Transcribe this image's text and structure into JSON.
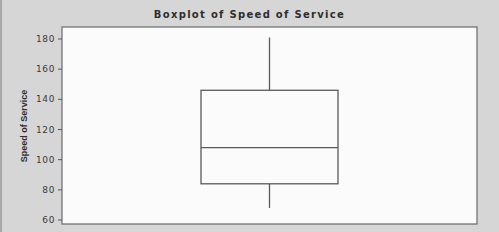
{
  "chart_data": {
    "type": "boxplot",
    "title": "Boxplot of Speed of Service",
    "xlabel": "",
    "ylabel": "Speed of Service",
    "ylim": [
      58,
      183
    ],
    "yticks": [
      60,
      80,
      100,
      120,
      140,
      160,
      180
    ],
    "grid": false,
    "legend": null,
    "series": [
      {
        "name": "Speed of Service",
        "whisker_low": 68,
        "q1": 84,
        "median": 108,
        "q3": 146,
        "whisker_high": 181
      }
    ]
  },
  "colors": {
    "background": "#d6d6d6",
    "plot_area": "#fbfbfb",
    "lines": "#5a5a5a",
    "text": "#2e2e2e"
  }
}
